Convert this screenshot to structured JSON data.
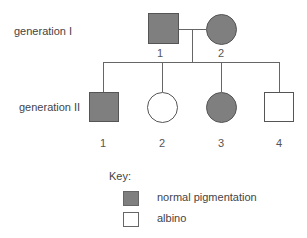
{
  "colors": {
    "affected": "#7f7f7f",
    "unaffected": "#ffffff",
    "line": "#666666"
  },
  "generations": [
    {
      "label": "generation I",
      "individuals": [
        {
          "number": "1",
          "sex": "male",
          "shape": "square",
          "phenotype": "normal pigmentation"
        },
        {
          "number": "2",
          "sex": "female",
          "shape": "circle",
          "phenotype": "normal pigmentation"
        }
      ]
    },
    {
      "label": "generation II",
      "individuals": [
        {
          "number": "1",
          "sex": "male",
          "shape": "square",
          "phenotype": "normal pigmentation"
        },
        {
          "number": "2",
          "sex": "female",
          "shape": "circle",
          "phenotype": "albino"
        },
        {
          "number": "3",
          "sex": "female",
          "shape": "circle",
          "phenotype": "normal pigmentation"
        },
        {
          "number": "4",
          "sex": "male",
          "shape": "square",
          "phenotype": "albino"
        }
      ]
    }
  ],
  "key": {
    "title": "Key:",
    "items": [
      {
        "label": "normal pigmentation",
        "swatch": "filled"
      },
      {
        "label": "albino",
        "swatch": "empty"
      }
    ]
  }
}
